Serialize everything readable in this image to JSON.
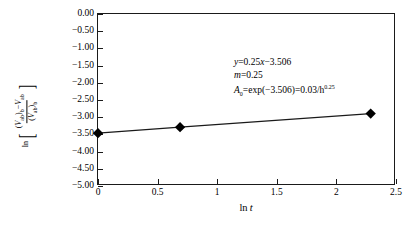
{
  "chart_data": {
    "type": "line",
    "title": "",
    "xlabel": "ln t",
    "ylabel": "ln[((V_ab)_b - V_ab)/(V_ab)_b]",
    "xlim": [
      0,
      2.5
    ],
    "ylim": [
      -5.0,
      0.0
    ],
    "grid": false,
    "legend": "none",
    "xticks": [
      "0",
      "0.5",
      "1",
      "1.5",
      "2",
      "2.5"
    ],
    "xtick_values": [
      0,
      0.5,
      1,
      1.5,
      2,
      2.5
    ],
    "yticks": [
      "0.00",
      "-0.50",
      "-1.00",
      "-1.50",
      "-2.00",
      "-2.50",
      "-3.00",
      "-3.50",
      "-4.00",
      "-4.50",
      "-5.00"
    ],
    "ytick_values": [
      0,
      -0.5,
      -1,
      -1.5,
      -2,
      -2.5,
      -3,
      -3.5,
      -4,
      -4.5,
      -5
    ],
    "series": [
      {
        "name": "data",
        "marker": "diamond",
        "marker_color": "#000000",
        "line_color": "#1a1a1a",
        "x": [
          0,
          0.693,
          2.303
        ],
        "y": [
          -3.506,
          -3.33,
          -2.93
        ]
      }
    ],
    "fit": {
      "slope": 0.25,
      "intercept": -3.506,
      "equation": "y = 0.25x - 3.506"
    },
    "annotations": [
      "y=0.25x−3.506",
      "m=0.25",
      "A0=exp(−3.506)=0.03/h^0.25"
    ]
  },
  "annotation": {
    "line1": {
      "var": "y",
      "body": "=0.25",
      "var2": "x",
      "tail": "−3.506"
    },
    "line2": {
      "var": "m",
      "body": "=0.25"
    },
    "line3": {
      "var": "A",
      "sub": "0",
      "body": "=exp(−3.506)=0.03/h",
      "sup": "0.25"
    }
  },
  "axes": {
    "x_title_prefix": "ln",
    "x_title_var": "t",
    "y_title": {
      "ln": "ln",
      "num_open": "(",
      "num_var": "V",
      "num_var_sub": "ab",
      "num_close_sub": "b",
      "num_minus": "−",
      "num_var2": "V",
      "num_var2_sub": "ab",
      "den_open": "(",
      "den_var": "V",
      "den_var_sub": "ab",
      "den_close_sub": "b"
    }
  }
}
